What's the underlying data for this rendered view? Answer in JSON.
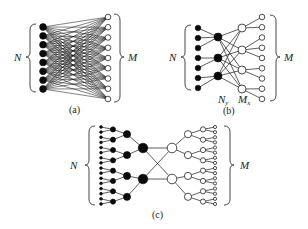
{
  "figure": {
    "panels": [
      {
        "id": "a",
        "caption": "(a)",
        "input_label": "N",
        "output_label": "M",
        "description": "Fully connected bipartite network",
        "input_nodes": 8,
        "output_nodes": 9
      },
      {
        "id": "b",
        "caption": "(b)",
        "input_label": "N",
        "output_label": "M",
        "hidden_left_label": "N",
        "hidden_left_sub": "y",
        "hidden_right_label": "M",
        "hidden_right_sub": "x",
        "description": "Two-stage network with intermediate layers",
        "input_nodes": 7,
        "hidden_left_nodes": 3,
        "hidden_right_nodes": 4,
        "output_nodes": 9
      },
      {
        "id": "c",
        "caption": "(c)",
        "input_label": "N",
        "output_label": "M",
        "description": "Hierarchical tree network (butterfly)",
        "layers_left": [
          16,
          8,
          4,
          2
        ],
        "layers_right": [
          2,
          4,
          8,
          16
        ]
      }
    ],
    "colors": {
      "filled_node": "#0a0a0a",
      "open_node": "#ffffff",
      "edge": "#1a1a1a"
    }
  }
}
